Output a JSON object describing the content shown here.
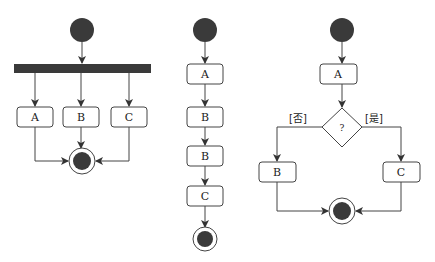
{
  "diagrams": [
    {
      "name": "parallel-fork",
      "nodes": {
        "a": "A",
        "b": "B",
        "c": "C"
      }
    },
    {
      "name": "sequential",
      "nodes": {
        "a": "A",
        "b1": "B",
        "b2": "B",
        "c": "C"
      }
    },
    {
      "name": "decision",
      "nodes": {
        "a": "A",
        "b": "B",
        "c": "C"
      },
      "decision": "?",
      "guards": {
        "no": "[否]",
        "yes": "[是]"
      }
    }
  ],
  "colors": {
    "fill": "#3a3a3a",
    "stroke": "#333333",
    "box_fill": "#ffffff"
  }
}
